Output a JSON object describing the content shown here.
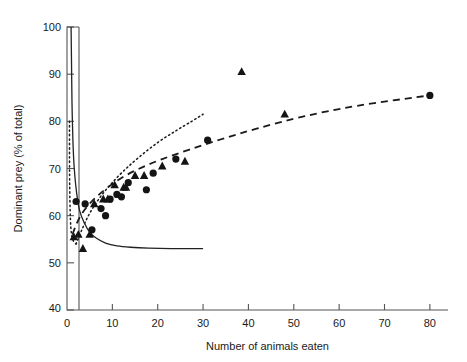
{
  "figure": {
    "background_color": "#ffffff",
    "ink_color": "#141414",
    "axis_color": "#555555"
  },
  "chart_data": {
    "type": "scatter",
    "title": "",
    "xlabel": "Number of animals eaten",
    "ylabel": "Dominant prey (% of total)",
    "xlim": [
      0,
      84
    ],
    "ylim": [
      40,
      100
    ],
    "xticks": [
      0,
      10,
      20,
      30,
      40,
      50,
      60,
      70,
      80
    ],
    "xtick_labels": [
      "0",
      "10",
      "20",
      "30",
      "40",
      "50",
      "60",
      "70",
      "80"
    ],
    "yticks": [
      40,
      50,
      60,
      70,
      80,
      90,
      100
    ],
    "ytick_labels": [
      "40",
      "50",
      "60",
      "70",
      "80",
      "90",
      "100"
    ],
    "grid": false,
    "legend": "none",
    "series": [
      {
        "name": "circles",
        "marker": "circle",
        "points": [
          [
            2.0,
            63.0
          ],
          [
            4.0,
            62.5
          ],
          [
            5.5,
            57.0
          ],
          [
            7.5,
            61.5
          ],
          [
            8.5,
            60.0
          ],
          [
            9.5,
            63.5
          ],
          [
            11.0,
            64.5
          ],
          [
            12.0,
            64.0
          ],
          [
            13.5,
            67.0
          ],
          [
            17.5,
            65.5
          ],
          [
            19.0,
            69.0
          ],
          [
            24.0,
            72.0
          ],
          [
            31.0,
            76.0
          ],
          [
            80.0,
            85.5
          ]
        ]
      },
      {
        "name": "triangles",
        "marker": "triangle",
        "points": [
          [
            1.5,
            55.5
          ],
          [
            2.5,
            56.0
          ],
          [
            3.5,
            53.0
          ],
          [
            5.0,
            56.0
          ],
          [
            6.0,
            62.5
          ],
          [
            8.0,
            63.5
          ],
          [
            9.0,
            63.5
          ],
          [
            10.5,
            66.5
          ],
          [
            12.5,
            66.0
          ],
          [
            13.0,
            66.0
          ],
          [
            15.0,
            68.5
          ],
          [
            17.0,
            68.5
          ],
          [
            21.0,
            70.5
          ],
          [
            26.0,
            71.5
          ],
          [
            38.5,
            90.5
          ],
          [
            48.0,
            81.5
          ]
        ]
      }
    ],
    "curves": [
      {
        "name": "solid-curve",
        "style": "solid",
        "description": "steeply decaying curve from 100% near x=1 flattening to ~53% by x=30",
        "points": [
          [
            0.9,
            100.0
          ],
          [
            1.0,
            92.0
          ],
          [
            1.1,
            84.0
          ],
          [
            1.3,
            76.0
          ],
          [
            1.6,
            70.0
          ],
          [
            2.1,
            65.0
          ],
          [
            2.8,
            61.0
          ],
          [
            3.8,
            58.5
          ],
          [
            5.0,
            56.5
          ],
          [
            6.5,
            55.2
          ],
          [
            8.5,
            54.2
          ],
          [
            11.0,
            53.6
          ],
          [
            14.0,
            53.3
          ],
          [
            18.0,
            53.1
          ],
          [
            23.0,
            53.0
          ],
          [
            30.0,
            53.0
          ]
        ]
      },
      {
        "name": "dashed-curve",
        "style": "dashed",
        "description": "rising saturating curve from ~55% at x=1 to ~85.5% at x=80",
        "points": [
          [
            1.2,
            56.0
          ],
          [
            2.0,
            58.0
          ],
          [
            3.0,
            60.0
          ],
          [
            4.5,
            62.0
          ],
          [
            6.5,
            64.0
          ],
          [
            9.0,
            66.0
          ],
          [
            12.0,
            68.0
          ],
          [
            16.0,
            70.0
          ],
          [
            21.0,
            72.0
          ],
          [
            27.0,
            74.0
          ],
          [
            34.0,
            76.2
          ],
          [
            42.0,
            78.5
          ],
          [
            52.0,
            81.0
          ],
          [
            64.0,
            83.3
          ],
          [
            80.0,
            85.5
          ]
        ]
      },
      {
        "name": "dotted-curve",
        "style": "dotted",
        "description": "near-vertical dotted rise at the axis then a steep rising branch out to x=30",
        "segments": [
          [
            [
              0.55,
              80.0
            ],
            [
              0.55,
              72.0
            ],
            [
              0.6,
              66.0
            ],
            [
              0.7,
              61.0
            ],
            [
              0.85,
              57.5
            ],
            [
              1.1,
              55.5
            ],
            [
              1.5,
              54.5
            ],
            [
              2.0,
              54.0
            ]
          ],
          [
            [
              2.0,
              54.0
            ],
            [
              3.5,
              57.5
            ],
            [
              5.0,
              60.5
            ],
            [
              7.0,
              63.5
            ],
            [
              9.5,
              66.5
            ],
            [
              12.5,
              69.5
            ],
            [
              16.0,
              72.5
            ],
            [
              20.0,
              75.5
            ],
            [
              24.0,
              78.0
            ],
            [
              27.5,
              80.0
            ],
            [
              30.0,
              81.5
            ]
          ]
        ]
      }
    ]
  }
}
